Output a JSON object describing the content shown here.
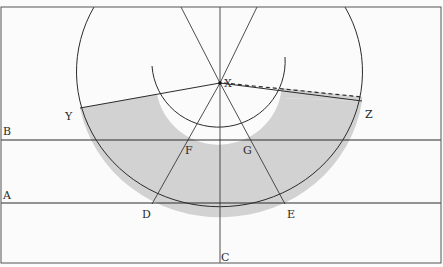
{
  "diagram": {
    "labels": {
      "X": "X",
      "Y": "Y",
      "Z": "Z",
      "A": "A",
      "B": "B",
      "C": "C",
      "D": "D",
      "E": "E",
      "F": "F",
      "G": "G"
    },
    "colors": {
      "background": "#fbfbfb",
      "shaded_region": "#d2d2d2",
      "line": "#2b2b2b",
      "frame": "#555555"
    }
  }
}
